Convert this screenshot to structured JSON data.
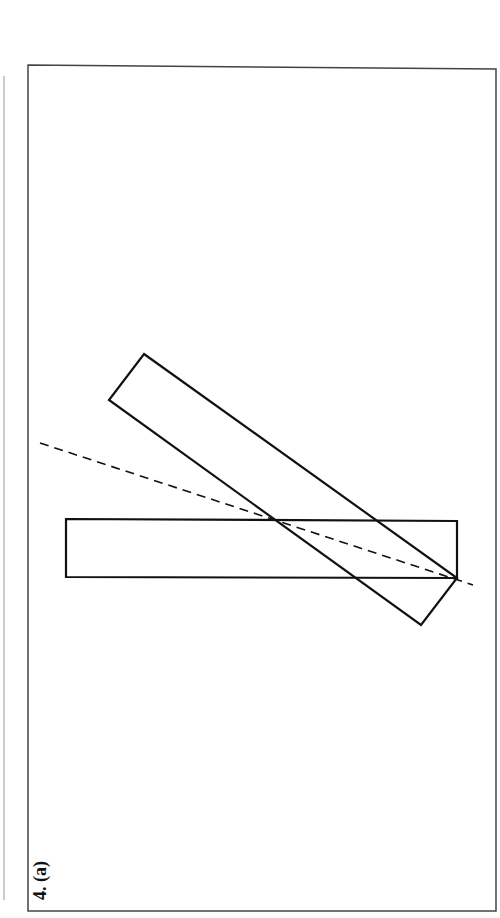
{
  "figure": {
    "label": "4. (a)",
    "colors": {
      "stroke": "#111111",
      "frame": "#444444",
      "margin_line": "#cccccc",
      "background": "#ffffff"
    },
    "frame": {
      "x1": 28,
      "y1_left": 65,
      "y1_right": 69,
      "x2": 496,
      "y2": 911
    },
    "margin_line": {
      "x": 4,
      "y1": 76,
      "y2": 900
    },
    "horizontal_rect": {
      "points": "66,519 457,521 457,578 66,577"
    },
    "tilted_rect": {
      "points": "144,354 457,578 421,625 109,400"
    },
    "dashed_line": {
      "x1": 40,
      "y1": 443,
      "x2": 473,
      "y2": 585
    }
  }
}
